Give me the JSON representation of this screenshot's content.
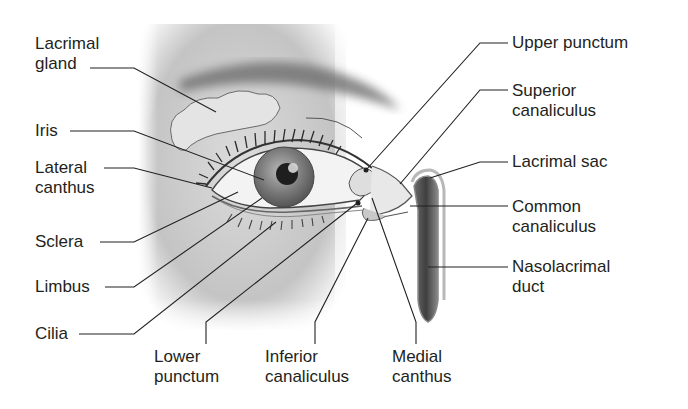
{
  "diagram": {
    "labels_left": [
      {
        "id": "lacrimal-gland",
        "line1": "Lacrimal",
        "line2": "gland"
      },
      {
        "id": "iris",
        "line1": "Iris",
        "line2": ""
      },
      {
        "id": "lateral-canthus",
        "line1": "Lateral",
        "line2": "canthus"
      },
      {
        "id": "sclera",
        "line1": "Sclera",
        "line2": ""
      },
      {
        "id": "limbus",
        "line1": "Limbus",
        "line2": ""
      },
      {
        "id": "cilia",
        "line1": "Cilia",
        "line2": ""
      }
    ],
    "labels_right": [
      {
        "id": "upper-punctum",
        "line1": "Upper punctum",
        "line2": ""
      },
      {
        "id": "superior-canaliculus",
        "line1": "Superior",
        "line2": "canaliculus"
      },
      {
        "id": "lacrimal-sac",
        "line1": "Lacrimal sac",
        "line2": ""
      },
      {
        "id": "common-canaliculus",
        "line1": "Common",
        "line2": "canaliculus"
      },
      {
        "id": "nasolacrimal-duct",
        "line1": "Nasolacrimal",
        "line2": "duct"
      }
    ],
    "labels_bottom": [
      {
        "id": "lower-punctum",
        "line1": "Lower",
        "line2": "punctum"
      },
      {
        "id": "inferior-canaliculus",
        "line1": "Inferior",
        "line2": "canaliculus"
      },
      {
        "id": "medial-canthus",
        "line1": "Medial",
        "line2": "canthus"
      }
    ]
  }
}
